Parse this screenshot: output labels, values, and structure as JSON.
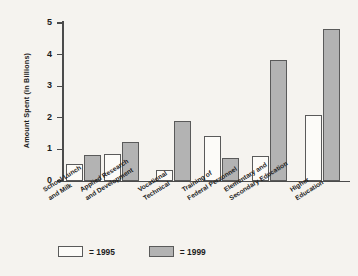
{
  "chart_data": {
    "type": "bar",
    "title": "",
    "xlabel": "",
    "ylabel": "Amount Spent (in Billions)",
    "ylim": [
      0,
      5
    ],
    "yticks": [
      "0",
      "1",
      "2",
      "3",
      "4",
      "5"
    ],
    "grid": false,
    "legend_position": "bottom-left",
    "categories": [
      "School Lunch\nand Milk",
      "Applied Research\nand Development",
      "Vocational\nTechnical",
      "Training of\nFederal Personnel",
      "Elementary and\nSecondary Education",
      "Higher\nEducation"
    ],
    "series": [
      {
        "name": "1995",
        "color": "#fcfbf8",
        "values": [
          0.54,
          0.87,
          0.35,
          1.42,
          0.79,
          2.08
        ]
      },
      {
        "name": "1999",
        "color": "#b3b3b3",
        "values": [
          0.83,
          1.25,
          1.9,
          0.72,
          3.82,
          4.8
        ]
      }
    ]
  },
  "legend": {
    "items": [
      {
        "label": "= 1995",
        "swatch": "white-swatch-icon"
      },
      {
        "label": "= 1999",
        "swatch": "gray-swatch-icon"
      }
    ]
  },
  "colors": {
    "background": "#f5f3ef",
    "axis": "#4b4b4b",
    "bar_1995": "#fcfbf8",
    "bar_1999": "#b3b3b3",
    "bar_outline": "#5a5a5a",
    "text": "#1c1c1c"
  }
}
